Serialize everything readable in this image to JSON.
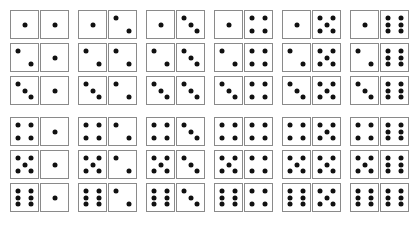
{
  "layout": {
    "columns_x": [
      10,
      78,
      146,
      214,
      282,
      350
    ],
    "rows_y": [
      10,
      43,
      76,
      117,
      150,
      183
    ]
  },
  "colors": {
    "pip": "#111111",
    "border": "#8a8a8a",
    "face": "#ffffff"
  },
  "dominoes": [
    {
      "left": 1,
      "right": 1
    },
    {
      "left": 1,
      "right": 2
    },
    {
      "left": 1,
      "right": 3
    },
    {
      "left": 1,
      "right": 4
    },
    {
      "left": 1,
      "right": 5
    },
    {
      "left": 1,
      "right": 6
    },
    {
      "left": 2,
      "right": 1
    },
    {
      "left": 2,
      "right": 2
    },
    {
      "left": 2,
      "right": 3
    },
    {
      "left": 2,
      "right": 4
    },
    {
      "left": 2,
      "right": 5
    },
    {
      "left": 2,
      "right": 6
    },
    {
      "left": 3,
      "right": 1
    },
    {
      "left": 3,
      "right": 2
    },
    {
      "left": 3,
      "right": 3
    },
    {
      "left": 3,
      "right": 4
    },
    {
      "left": 3,
      "right": 5
    },
    {
      "left": 3,
      "right": 6
    },
    {
      "left": 4,
      "right": 1
    },
    {
      "left": 4,
      "right": 2
    },
    {
      "left": 4,
      "right": 3
    },
    {
      "left": 4,
      "right": 4
    },
    {
      "left": 4,
      "right": 5
    },
    {
      "left": 4,
      "right": 6
    },
    {
      "left": 5,
      "right": 1
    },
    {
      "left": 5,
      "right": 2
    },
    {
      "left": 5,
      "right": 3
    },
    {
      "left": 5,
      "right": 4
    },
    {
      "left": 5,
      "right": 5
    },
    {
      "left": 5,
      "right": 6
    },
    {
      "left": 6,
      "right": 1
    },
    {
      "left": 6,
      "right": 2
    },
    {
      "left": 6,
      "right": 3
    },
    {
      "left": 6,
      "right": 4
    },
    {
      "left": 6,
      "right": 5
    },
    {
      "left": 6,
      "right": 6
    }
  ]
}
